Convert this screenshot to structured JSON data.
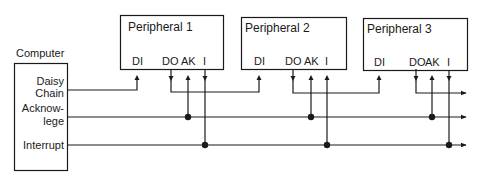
{
  "computer": {
    "title": "Computer",
    "signals": {
      "daisy_line1": "Daisy",
      "daisy_line2": "Chain",
      "ack_line1": "Acknow-",
      "ack_line2": "lege",
      "interrupt": "Interrupt"
    }
  },
  "peripherals": [
    {
      "title": "Peripheral 1",
      "pins": {
        "di": "DI",
        "do": "DO",
        "ak": "AK",
        "i": "I"
      }
    },
    {
      "title": "Peripheral 2",
      "pins": {
        "di": "DI",
        "do": "DO",
        "ak": "AK",
        "i": "I"
      }
    },
    {
      "title": "Peripheral 3",
      "pins": {
        "di": "DI",
        "do": "DO",
        "ak": "AK",
        "i": "I"
      }
    }
  ],
  "colors": {
    "line": "#1a1a1a",
    "background": "#ffffff"
  }
}
